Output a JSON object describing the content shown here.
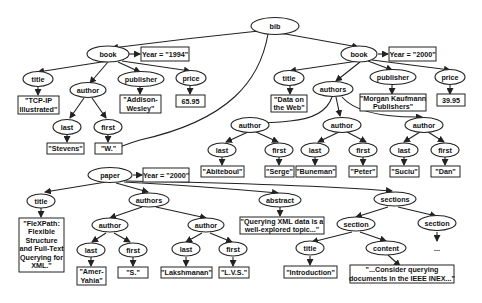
{
  "diagram": {
    "type": "xml-tree",
    "root": "bib",
    "nodes": {
      "bib": "bib",
      "book1": "book",
      "book1_attr": "Year = \"1994\"",
      "book1_title": "title",
      "book1_title_val": [
        "\"TCP-IP",
        "Illustrated\""
      ],
      "book1_author": "author",
      "book1_author_last": "last",
      "book1_author_last_val": "\"Stevens\"",
      "book1_author_first": "first",
      "book1_author_first_val": "\"W.\"",
      "book1_publisher": "publisher",
      "book1_publisher_val": [
        "\"Addison-",
        "Wesley\""
      ],
      "book1_price": "price",
      "book1_price_val": "65.95",
      "book2": "book",
      "book2_attr": "Year = \"2000\"",
      "book2_title": "title",
      "book2_title_val": [
        "\"Data on",
        "the Web\""
      ],
      "book2_authors": "authors",
      "book2_author1": "author",
      "book2_author1_last": "last",
      "book2_author1_last_val": "\"Abiteboul\"",
      "book2_author1_first": "first",
      "book2_author1_first_val": "\"Serge\"",
      "book2_author2": "author",
      "book2_author2_last": "last",
      "book2_author2_last_val": "\"Buneman\"",
      "book2_author2_first": "first",
      "book2_author2_first_val": "\"Peter\"",
      "book2_author3": "author",
      "book2_author3_last": "last",
      "book2_author3_last_val": "\"Suciu\"",
      "book2_author3_first": "first",
      "book2_author3_first_val": "\"Dan\"",
      "book2_publisher": "publisher",
      "book2_publisher_val": [
        "\"Morgan Kaufmann",
        "Publishers\""
      ],
      "book2_price": "price",
      "book2_price_val": "39.95",
      "paper": "paper",
      "paper_attr": "Year = \"2000\"",
      "paper_title": "title",
      "paper_title_val": [
        "\"FleXPath:",
        "Flexible",
        "Structure",
        "and Full-Text",
        "Querying for",
        "XML.\""
      ],
      "paper_authors": "authors",
      "paper_author1": "author",
      "paper_author1_last": "last",
      "paper_author1_last_val": [
        "\"Amer-",
        "Yahia\""
      ],
      "paper_author1_first": "first",
      "paper_author1_first_val": "\"S.\"",
      "paper_author2": "author",
      "paper_author2_last": "last",
      "paper_author2_last_val": "\"Lakshmanan\"",
      "paper_author2_first": "first",
      "paper_author2_first_val": "\"L.V.S.\"",
      "paper_abstract": "abstract",
      "paper_abstract_val": [
        "\"Querying XML data is a",
        "well-explored topic...\""
      ],
      "paper_sections": "sections",
      "section1": "section",
      "section1_title": "title",
      "section1_title_val": "\"Introduction\"",
      "section1_content": "content",
      "section1_content_val": [
        "\"...Consider querying",
        "documents in the IEEE INEX...\""
      ],
      "section2": "section",
      "section2_more": "..."
    }
  }
}
